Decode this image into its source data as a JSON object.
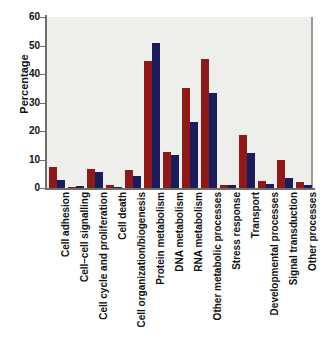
{
  "chart_data": {
    "type": "bar",
    "title": "",
    "xlabel": "",
    "ylabel": "Percentage",
    "ylim": [
      0,
      60
    ],
    "yticks": [
      0,
      10,
      20,
      30,
      40,
      50,
      60
    ],
    "grid": false,
    "legend": "none",
    "categories": [
      "Cell adhesion",
      "Cell–cell signalling",
      "Cell cycle and proliferation",
      "Cell death",
      "Cell organization/biogenesis",
      "Protein metabolism",
      "DNA metabolism",
      "RNA metabolism",
      "Other metabolic processes",
      "Stress response",
      "Transport",
      "Developmental processes",
      "Signal transduction",
      "Other processes"
    ],
    "series": [
      {
        "name": "series-1",
        "color": "#8b1a18",
        "values": [
          7.5,
          0.5,
          6.8,
          1.0,
          6.2,
          44.5,
          12.5,
          35.0,
          45.2,
          1.0,
          18.5,
          2.5,
          9.8,
          2.0
        ]
      },
      {
        "name": "series-2",
        "color": "#1b1b5e",
        "values": [
          2.8,
          0.8,
          5.5,
          0.3,
          4.2,
          51.0,
          11.5,
          23.0,
          33.5,
          1.2,
          12.2,
          1.5,
          3.5,
          1.2
        ]
      }
    ],
    "colors": {
      "series_1": "#8b1a18",
      "series_2": "#1b1b5e",
      "plot_background": "#eeeeea",
      "axis": "#6e6e6a"
    }
  }
}
